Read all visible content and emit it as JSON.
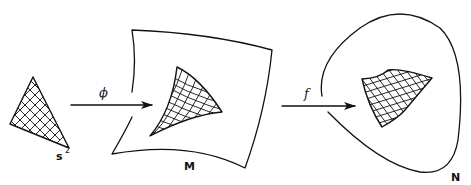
{
  "diagram": {
    "type": "mapping-sequence",
    "nodes": [
      {
        "id": "s2",
        "label": "s",
        "superscript": "2",
        "shape": "gridded-triangle"
      },
      {
        "id": "M",
        "label": "M",
        "shape": "curved-quadrilateral-sheet",
        "contains": "gridded curved triangle (image of s²)"
      },
      {
        "id": "N",
        "label": "N",
        "shape": "rounded-triangular-blob",
        "contains": "gridded curved patch (image under f)"
      }
    ],
    "arrows": [
      {
        "from": "s2",
        "to": "M",
        "label": "ϕ"
      },
      {
        "from": "M",
        "to": "N",
        "label": "f"
      }
    ]
  },
  "labels": {
    "s2_base": "s",
    "s2_sup": "2",
    "M": "M",
    "N": "N",
    "phi": "ϕ",
    "f": "f"
  }
}
